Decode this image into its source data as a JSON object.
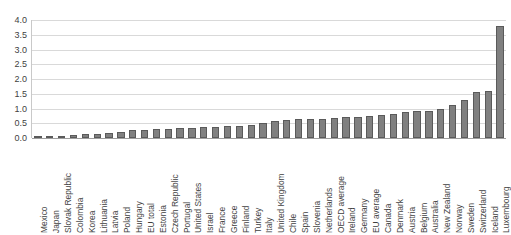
{
  "chart_data": {
    "type": "bar",
    "title": "",
    "subtitle": "",
    "xlabel": "",
    "ylabel": "",
    "ylim": [
      0.0,
      4.0
    ],
    "ytick_labels": [
      "4.0",
      "3.5",
      "3.0",
      "2.5",
      "2.0",
      "1.5",
      "1.0",
      "0.5",
      "0.0"
    ],
    "ytick_values": [
      4.0,
      3.5,
      3.0,
      2.5,
      2.0,
      1.5,
      1.0,
      0.5,
      0.0
    ],
    "grid": true,
    "legend": "none",
    "orientation": "vertical",
    "bar_color": "#808080",
    "bar_edge_color": "#5a5a5a",
    "gridline_color": "#d9d9d9",
    "axis_color": "#9e9e9e",
    "label_color": "#3f3f3f",
    "categories": [
      "Mexico",
      "Japan",
      "Slovak Republic",
      "Colombia",
      "Korea",
      "Lithuania",
      "Latvia",
      "Poland",
      "Hungary",
      "EU total",
      "Estonia",
      "Czech Republic",
      "Portugal",
      "United States",
      "Israel",
      "France",
      "Greece",
      "Finland",
      "Turkey",
      "Italy",
      "United Kingdom",
      "Chile",
      "Spain",
      "Slovenia",
      "Netherlands",
      "OECD average",
      "Ireland",
      "Germany",
      "EU average",
      "Canada",
      "Denmark",
      "Austria",
      "Belgium",
      "Australia",
      "New Zealand",
      "Norway",
      "Sweden",
      "Switzerland",
      "Iceland",
      "Luxembourg"
    ],
    "values": [
      0.03,
      0.05,
      0.07,
      0.09,
      0.12,
      0.15,
      0.18,
      0.22,
      0.26,
      0.28,
      0.3,
      0.31,
      0.33,
      0.35,
      0.37,
      0.39,
      0.4,
      0.42,
      0.44,
      0.5,
      0.57,
      0.61,
      0.64,
      0.66,
      0.66,
      0.68,
      0.7,
      0.72,
      0.74,
      0.78,
      0.83,
      0.87,
      0.9,
      0.93,
      1.0,
      1.13,
      1.3,
      1.55,
      1.6,
      3.8
    ]
  }
}
